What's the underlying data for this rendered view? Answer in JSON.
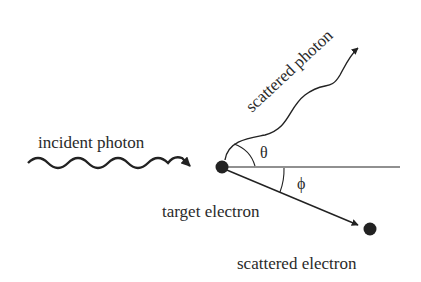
{
  "diagram": {
    "labels": {
      "incident_photon": "incident photon",
      "scattered_photon": "scattered photon",
      "target_electron": "target electron",
      "scattered_electron": "scattered electron",
      "theta": "θ",
      "phi": "ϕ"
    },
    "colors": {
      "stroke": "#222222",
      "dot": "#222222",
      "text": "#2a2a2a",
      "background": "#ffffff"
    }
  }
}
